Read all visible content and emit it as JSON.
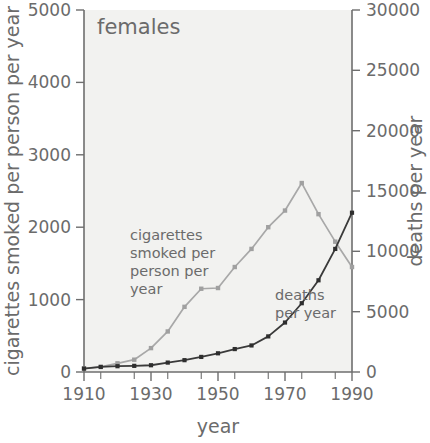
{
  "panel": {
    "title": "females"
  },
  "axes": {
    "x": {
      "label": "year",
      "ticks": [
        1910,
        1930,
        1950,
        1970,
        1990
      ],
      "tick_labels": [
        "1910",
        "1930",
        "1950",
        "1970",
        "1990"
      ],
      "minor_step": 5,
      "range": [
        1910,
        1990
      ]
    },
    "y_left": {
      "label": "cigarettes smoked per person per year",
      "ticks": [
        0,
        1000,
        2000,
        3000,
        4000,
        5000
      ],
      "tick_labels": [
        "0",
        "1000",
        "2000",
        "3000",
        "4000",
        "5000"
      ],
      "range": [
        0,
        5000
      ]
    },
    "y_right": {
      "label": "deaths per year",
      "ticks": [
        0,
        5000,
        10000,
        15000,
        20000,
        25000,
        30000
      ],
      "tick_labels": [
        "0",
        "5000",
        "10000",
        "15000",
        "20000",
        "25000",
        "30000"
      ],
      "range": [
        0,
        30000
      ]
    }
  },
  "annotations": [
    {
      "name": "cigarettes-series-label",
      "text": "cigarettes\nsmoked per\nperson per\nyear",
      "lines": [
        "cigarettes",
        "smoked per",
        "person per",
        "year"
      ]
    },
    {
      "name": "deaths-series-label",
      "text": "deaths\nper year",
      "lines": [
        "deaths",
        "per year"
      ]
    }
  ],
  "colors": {
    "cigarettes_line": "#a8a8a8",
    "deaths_line": "#3a3a3a",
    "plot_background": "#f2f2f0",
    "axis": "#6e6e6e",
    "text": "#6b6b6b"
  },
  "chart_data": {
    "type": "line",
    "title": "females",
    "xlabel": "year",
    "ylabel": "cigarettes smoked per person per year",
    "ylabel_right": "deaths per year",
    "xlim": [
      1910,
      1990
    ],
    "ylim": [
      0,
      5000
    ],
    "ylim_right": [
      0,
      30000
    ],
    "grid": false,
    "legend": "inline-annotations",
    "x": [
      1910,
      1915,
      1920,
      1925,
      1930,
      1935,
      1940,
      1945,
      1950,
      1955,
      1960,
      1965,
      1970,
      1975,
      1980,
      1985,
      1990
    ],
    "series": [
      {
        "name": "cigarettes smoked per person per year",
        "axis": "left",
        "units": "cigarettes per person per year",
        "color": "#a8a8a8",
        "values": [
          50,
          70,
          120,
          170,
          330,
          560,
          900,
          1150,
          1160,
          1450,
          1700,
          2000,
          2230,
          2610,
          2180,
          1800,
          1450
        ]
      },
      {
        "name": "deaths per year",
        "axis": "right",
        "units": "deaths per year",
        "color": "#3a3a3a",
        "values": [
          280,
          420,
          480,
          510,
          560,
          780,
          980,
          1250,
          1550,
          1900,
          2200,
          2950,
          4100,
          5700,
          7600,
          10200,
          13200
        ]
      }
    ],
    "notes": [
      "Deaths series plotted against the right-hand axis (0-30000).",
      "Cigarettes series peaks near 1975 then declines through 1990.",
      "The two curves cross at approximately 1985."
    ]
  }
}
